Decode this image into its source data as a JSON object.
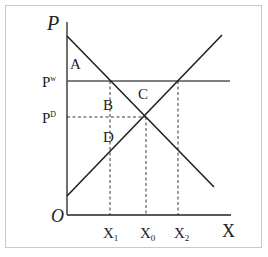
{
  "diagram": {
    "type": "supply-demand",
    "axes": {
      "y_label": "P",
      "x_label": "X",
      "origin_label": "O"
    },
    "price_labels": {
      "world": {
        "base": "P",
        "sup": "w"
      },
      "domestic": {
        "base": "P",
        "sup": "D"
      }
    },
    "quantity_labels": {
      "x1": {
        "base": "X",
        "sub": "1"
      },
      "x0": {
        "base": "X",
        "sub": "0"
      },
      "x2": {
        "base": "X",
        "sub": "2"
      }
    },
    "regions": {
      "a": "A",
      "b": "B",
      "c": "C",
      "d": "D"
    },
    "curves": [
      {
        "name": "demand",
        "from": [
          67,
          36
        ],
        "to": [
          214,
          187
        ]
      },
      {
        "name": "supply",
        "from": [
          67,
          196
        ],
        "to": [
          222,
          35
        ]
      },
      {
        "name": "world-price-line",
        "y": 81
      },
      {
        "name": "domestic-price-line",
        "y": 117,
        "dashed": true
      }
    ],
    "colors": {
      "line": "#222222",
      "world_price_line": "#555555",
      "frame": "#c8c8c8"
    }
  }
}
